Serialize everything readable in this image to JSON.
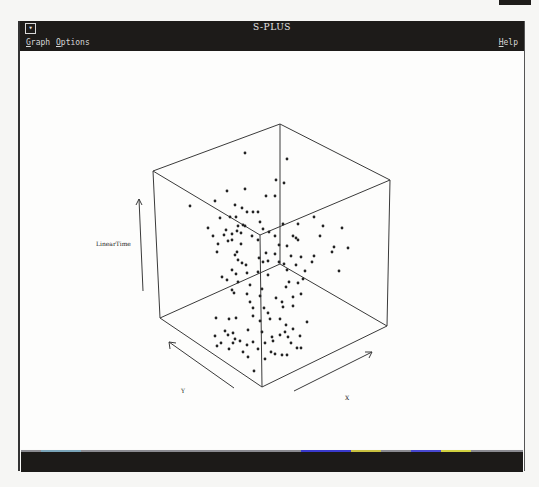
{
  "window": {
    "title": "S-PLUS",
    "system_menu_glyph": "▾"
  },
  "menubar": {
    "items": [
      {
        "label": "Graph",
        "mnemonic": "G"
      },
      {
        "label": "Options",
        "mnemonic": "O"
      },
      {
        "label": "Help",
        "mnemonic": "H"
      }
    ]
  },
  "plot": {
    "vertical_axis_label": "LinearTime",
    "x_axis_label": "X",
    "y_axis_label": "Y"
  },
  "chart_data": {
    "type": "scatter",
    "subtype": "3d-scatter-cube",
    "title": "",
    "axes": {
      "vertical": "LinearTime",
      "x": "X",
      "y": "Y"
    },
    "grid": false,
    "legend": null,
    "projected_points": [
      [
        243,
        153
      ],
      [
        285,
        159
      ],
      [
        274,
        180
      ],
      [
        282,
        183
      ],
      [
        243,
        189
      ],
      [
        225,
        191
      ],
      [
        213,
        201
      ],
      [
        188,
        206
      ],
      [
        264,
        196
      ],
      [
        273,
        196
      ],
      [
        233,
        205
      ],
      [
        240,
        208
      ],
      [
        245,
        212
      ],
      [
        251,
        212
      ],
      [
        256,
        212
      ],
      [
        234,
        217
      ],
      [
        228,
        217
      ],
      [
        218,
        218
      ],
      [
        281,
        224
      ],
      [
        296,
        224
      ],
      [
        312,
        217
      ],
      [
        236,
        226
      ],
      [
        241,
        225
      ],
      [
        258,
        222
      ],
      [
        206,
        228
      ],
      [
        235,
        231
      ],
      [
        224,
        230
      ],
      [
        239,
        233
      ],
      [
        243,
        226
      ],
      [
        261,
        229
      ],
      [
        267,
        232
      ],
      [
        273,
        236
      ],
      [
        291,
        236
      ],
      [
        321,
        226
      ],
      [
        340,
        228
      ],
      [
        211,
        236
      ],
      [
        222,
        235
      ],
      [
        230,
        234
      ],
      [
        294,
        238
      ],
      [
        296,
        240
      ],
      [
        318,
        236
      ],
      [
        250,
        236
      ],
      [
        216,
        244
      ],
      [
        226,
        241
      ],
      [
        230,
        240
      ],
      [
        239,
        244
      ],
      [
        256,
        240
      ],
      [
        277,
        245
      ],
      [
        285,
        246
      ],
      [
        332,
        247
      ],
      [
        346,
        248
      ],
      [
        215,
        252
      ],
      [
        233,
        255
      ],
      [
        235,
        252
      ],
      [
        264,
        253
      ],
      [
        273,
        254
      ],
      [
        289,
        256
      ],
      [
        299,
        257
      ],
      [
        312,
        256
      ],
      [
        330,
        252
      ],
      [
        236,
        260
      ],
      [
        240,
        263
      ],
      [
        244,
        265
      ],
      [
        257,
        258
      ],
      [
        261,
        262
      ],
      [
        266,
        261
      ],
      [
        277,
        262
      ],
      [
        282,
        264
      ],
      [
        294,
        265
      ],
      [
        310,
        262
      ],
      [
        337,
        271
      ],
      [
        230,
        270
      ],
      [
        234,
        274
      ],
      [
        245,
        273
      ],
      [
        256,
        272
      ],
      [
        266,
        275
      ],
      [
        285,
        270
      ],
      [
        303,
        271
      ],
      [
        220,
        277
      ],
      [
        225,
        280
      ],
      [
        236,
        282
      ],
      [
        248,
        285
      ],
      [
        260,
        289
      ],
      [
        284,
        287
      ],
      [
        287,
        282
      ],
      [
        296,
        283
      ],
      [
        301,
        279
      ],
      [
        230,
        290
      ],
      [
        232,
        293
      ],
      [
        245,
        294
      ],
      [
        258,
        296
      ],
      [
        274,
        298
      ],
      [
        280,
        302
      ],
      [
        291,
        297
      ],
      [
        299,
        294
      ],
      [
        248,
        302
      ],
      [
        251,
        308
      ],
      [
        262,
        308
      ],
      [
        266,
        313
      ],
      [
        281,
        307
      ],
      [
        291,
        306
      ],
      [
        214,
        318
      ],
      [
        227,
        319
      ],
      [
        234,
        318
      ],
      [
        251,
        316
      ],
      [
        258,
        321
      ],
      [
        268,
        319
      ],
      [
        278,
        319
      ],
      [
        284,
        325
      ],
      [
        223,
        331
      ],
      [
        226,
        335
      ],
      [
        231,
        333
      ],
      [
        233,
        339
      ],
      [
        246,
        330
      ],
      [
        260,
        332
      ],
      [
        270,
        337
      ],
      [
        278,
        335
      ],
      [
        283,
        332
      ],
      [
        291,
        329
      ],
      [
        305,
        322
      ],
      [
        227,
        349
      ],
      [
        231,
        343
      ],
      [
        238,
        341
      ],
      [
        245,
        345
      ],
      [
        251,
        342
      ],
      [
        263,
        343
      ],
      [
        271,
        341
      ],
      [
        286,
        337
      ],
      [
        289,
        343
      ],
      [
        298,
        336
      ],
      [
        213,
        336
      ],
      [
        215,
        346
      ],
      [
        219,
        343
      ],
      [
        241,
        352
      ],
      [
        256,
        349
      ],
      [
        269,
        352
      ],
      [
        280,
        355
      ],
      [
        295,
        348
      ],
      [
        246,
        357
      ],
      [
        263,
        359
      ],
      [
        273,
        354
      ],
      [
        285,
        355
      ],
      [
        252,
        371
      ],
      [
        299,
        348
      ]
    ]
  },
  "colors": {
    "titlebar": "#1d1b19",
    "title_text": "#e6e6e6",
    "canvas": "#fdfdfc",
    "ink": "#2a2a2a",
    "statusbar": "#1c1a18"
  }
}
